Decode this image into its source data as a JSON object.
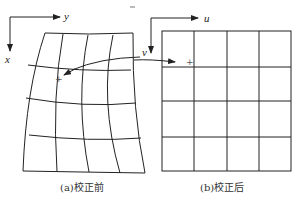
{
  "diagram": {
    "type": "image-correction-grid",
    "colors": {
      "line": "#222222",
      "background": "#ffffff"
    },
    "left_panel": {
      "axes": {
        "horizontal_label": "y",
        "vertical_label": "x"
      },
      "grid": {
        "rows": 4,
        "cols": 4,
        "style": "distorted"
      },
      "caption": "(a)校正前"
    },
    "right_panel": {
      "axes": {
        "horizontal_label": "u",
        "vertical_label": "v"
      },
      "grid": {
        "rows": 4,
        "cols": 4,
        "style": "regular"
      },
      "caption": "(b)校正后"
    },
    "mapping_arrow": {
      "from": "point-in-left-grid",
      "to": "point-in-right-grid",
      "bidirectional": true,
      "marker": "+"
    }
  }
}
